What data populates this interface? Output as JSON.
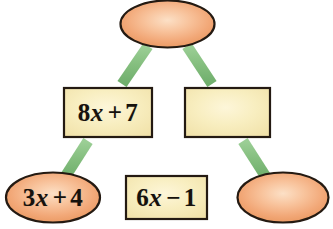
{
  "diagram": {
    "type": "triangle-network-puzzle",
    "palette": {
      "oval_fill": "#f3a977",
      "oval_highlight": "#fbd9b8",
      "oval_stroke": "#241a12",
      "rect_fill": "#f6e8b4",
      "rect_highlight": "#fdf6d8",
      "rect_stroke": "#241a12",
      "connector": "#82bd7e",
      "background": "#ffffff",
      "text": "#16120d"
    },
    "nodes": [
      {
        "id": "top-oval",
        "shape": "ellipse",
        "name": "top-oval-node",
        "text": "",
        "empty": true,
        "cx": 167.5,
        "cy": 24,
        "rx": 47.5,
        "ry": 24
      },
      {
        "id": "left-rect",
        "shape": "rectangle",
        "name": "left-rectangle-node",
        "text": "8x + 7",
        "coefficient": "8",
        "variable": "x",
        "operator": "+",
        "constant": "7",
        "empty": false,
        "x": 63,
        "y": 87,
        "w": 90,
        "h": 51
      },
      {
        "id": "right-rect",
        "shape": "rectangle",
        "name": "right-rectangle-node",
        "text": "",
        "empty": true,
        "x": 184,
        "y": 87,
        "w": 87,
        "h": 51
      },
      {
        "id": "bottom-left-oval",
        "shape": "ellipse",
        "name": "bottom-left-oval-node",
        "text": "3x + 4",
        "coefficient": "3",
        "variable": "x",
        "operator": "+",
        "constant": "4",
        "empty": false,
        "cx": 53,
        "cy": 197.5,
        "rx": 48,
        "ry": 25.5
      },
      {
        "id": "bottom-rect",
        "shape": "rectangle",
        "name": "bottom-rectangle-node",
        "text": "6x − 1",
        "coefficient": "6",
        "variable": "x",
        "operator": "−",
        "constant": "1",
        "empty": false,
        "x": 125,
        "y": 175,
        "w": 83,
        "h": 45
      },
      {
        "id": "bottom-right-oval",
        "shape": "ellipse",
        "name": "bottom-right-oval-node",
        "text": "",
        "empty": true,
        "cx": 283,
        "cy": 197.5,
        "rx": 46,
        "ry": 25.5
      }
    ],
    "connectors": [
      {
        "id": "c1",
        "name": "connector-top-to-left-rect",
        "from": "top-oval",
        "to": "left-rect",
        "x1": 148,
        "y1": 46,
        "x2": 122,
        "y2": 84
      },
      {
        "id": "c2",
        "name": "connector-top-to-right-rect",
        "from": "top-oval",
        "to": "right-rect",
        "x1": 187,
        "y1": 46,
        "x2": 212,
        "y2": 84
      },
      {
        "id": "c3",
        "name": "connector-left-rect-to-bl-oval",
        "from": "left-rect",
        "to": "bottom-left-oval",
        "x1": 88,
        "y1": 141,
        "x2": 65,
        "y2": 176
      },
      {
        "id": "c4",
        "name": "connector-right-rect-to-br-oval",
        "from": "right-rect",
        "to": "bottom-right-oval",
        "x1": 243,
        "y1": 141,
        "x2": 266,
        "y2": 176
      },
      {
        "id": "c5",
        "name": "connector-bl-oval-to-bottom-rect",
        "from": "bottom-left-oval",
        "to": "bottom-rect",
        "x1": 103,
        "y1": 197,
        "x2": 123,
        "y2": 197
      },
      {
        "id": "c6",
        "name": "connector-bottom-rect-to-br-oval",
        "from": "bottom-rect",
        "to": "bottom-right-oval",
        "x1": 210,
        "y1": 197,
        "x2": 236,
        "y2": 197
      }
    ]
  },
  "labels": {
    "top_oval": "",
    "left_rect": {
      "coef": "8",
      "var": "x",
      "op": "+",
      "const": "7"
    },
    "right_rect": "",
    "bottom_left_oval": {
      "coef": "3",
      "var": "x",
      "op": "+",
      "const": "4"
    },
    "bottom_rect": {
      "coef": "6",
      "var": "x",
      "op": "−",
      "const": "1"
    },
    "bottom_right_oval": ""
  }
}
